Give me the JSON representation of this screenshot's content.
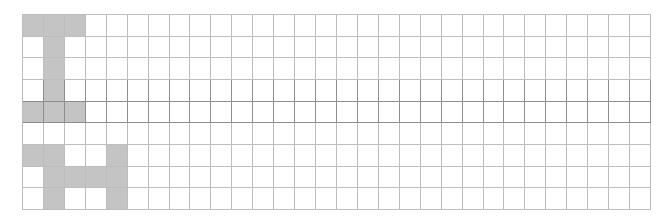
{
  "grid": {
    "rows": 9,
    "cols": 30,
    "fill_color": "#c4c4c4",
    "line_color": "#bdbdbd",
    "dark_line_color": "#8e8e8e",
    "dark_rows": [
      3,
      4
    ],
    "dark_bottom_rows": [
      3,
      4
    ],
    "filled_cells": [
      [
        0,
        0
      ],
      [
        0,
        1
      ],
      [
        0,
        2
      ],
      [
        1,
        1
      ],
      [
        2,
        1
      ],
      [
        3,
        1
      ],
      [
        4,
        0
      ],
      [
        4,
        1
      ],
      [
        4,
        2
      ],
      [
        6,
        0
      ],
      [
        6,
        1
      ],
      [
        6,
        4
      ],
      [
        7,
        1
      ],
      [
        7,
        2
      ],
      [
        7,
        3
      ],
      [
        7,
        4
      ],
      [
        8,
        1
      ],
      [
        8,
        4
      ]
    ]
  }
}
